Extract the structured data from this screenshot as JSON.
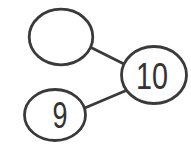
{
  "diagram": {
    "type": "number-bond",
    "background_color": "#ffffff",
    "stroke_color": "#3a3a3a",
    "text_color": "#333333",
    "nodes": {
      "top_left": {
        "label": ""
      },
      "right": {
        "label": "10"
      },
      "bottom_left": {
        "label": "9"
      }
    },
    "edges": [
      {
        "from": "top_left",
        "to": "right"
      },
      {
        "from": "bottom_left",
        "to": "right"
      }
    ]
  }
}
